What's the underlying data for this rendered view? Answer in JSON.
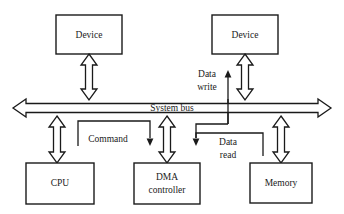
{
  "diagram": {
    "type": "block-diagram",
    "canvas": {
      "width": 344,
      "height": 214
    },
    "colors": {
      "stroke": "#1a1a1a",
      "fill": "#ffffff",
      "background": "#ffffff"
    },
    "nodes": [
      {
        "id": "device_top_left",
        "label": "Device",
        "label2": "",
        "x": 56,
        "y": 15,
        "w": 66,
        "h": 39
      },
      {
        "id": "device_top_right",
        "label": "Device",
        "label2": "",
        "x": 212,
        "y": 15,
        "w": 66,
        "h": 39
      },
      {
        "id": "cpu",
        "label": "CPU",
        "label2": "",
        "x": 26,
        "y": 163,
        "w": 68,
        "h": 41
      },
      {
        "id": "dma_controller",
        "label": "DMA",
        "label2": "controller",
        "x": 134,
        "y": 163,
        "w": 66,
        "h": 41
      },
      {
        "id": "memory",
        "label": "Memory",
        "label2": "",
        "x": 250,
        "y": 163,
        "w": 62,
        "h": 40
      }
    ],
    "bus": {
      "id": "system_bus",
      "label": "System bus",
      "x1": 13,
      "x2": 331,
      "y": 108,
      "thickness": 16,
      "bidirectional": true
    },
    "connectors": [
      {
        "id": "device_top_left_bus",
        "kind": "double-arrow-vertical",
        "x": 89,
        "from_y": 54,
        "to_y": 100
      },
      {
        "id": "device_top_right_bus",
        "kind": "double-arrow-vertical",
        "x": 245,
        "from_y": 54,
        "to_y": 100
      },
      {
        "id": "cpu_bus",
        "kind": "double-arrow-vertical",
        "x": 57,
        "from_y": 116,
        "to_y": 163
      },
      {
        "id": "dma_bus",
        "kind": "double-arrow-vertical",
        "x": 167,
        "from_y": 116,
        "to_y": 163
      },
      {
        "id": "memory_bus",
        "kind": "double-arrow-vertical",
        "x": 281,
        "from_y": 116,
        "to_y": 163
      }
    ],
    "signals": [
      {
        "id": "command",
        "label": "Command",
        "label_line1": "Command",
        "label_line2": "",
        "direction": "cpu-to-dma-controller",
        "arrowhead": "down"
      },
      {
        "id": "data_write",
        "label": "Data write",
        "label_line1": "Data",
        "label_line2": "write",
        "direction": "up-to-device",
        "arrowhead": "up"
      },
      {
        "id": "data_read",
        "label": "Data read",
        "label_line1": "Data",
        "label_line2": "read",
        "direction": "memory-to-bus",
        "arrowhead": "down"
      }
    ]
  }
}
